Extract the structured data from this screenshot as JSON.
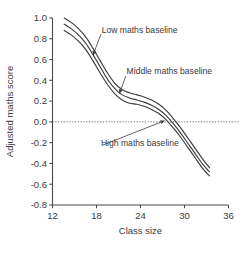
{
  "chart_data": {
    "type": "line",
    "title": "",
    "xlabel": "Class size",
    "ylabel": "Adjusted maths score",
    "xlim": [
      12,
      36
    ],
    "ylim": [
      -0.8,
      1.0
    ],
    "xticks": [
      12,
      18,
      24,
      30,
      36
    ],
    "yticks": [
      1.0,
      0.8,
      0.6,
      0.4,
      0.2,
      0.0,
      -0.2,
      -0.4,
      -0.6,
      -0.8
    ],
    "xtick_labels": [
      "12",
      "18",
      "24",
      "30",
      "36"
    ],
    "ytick_labels": [
      "1.0",
      "0.8",
      "0.6",
      "0.4",
      "0.2",
      "0.0",
      "-0.2",
      "-0.4",
      "-0.6",
      "-0.8"
    ],
    "grid": false,
    "legend_position": "inline-annotations",
    "reference_lines": [
      {
        "name": "zero-line",
        "axis": "y",
        "value": 0.0,
        "style": "dotted"
      }
    ],
    "series": [
      {
        "name": "Low maths baseline",
        "color": "#3b3b3b",
        "x": [
          13.6,
          14.5,
          15.5,
          16.5,
          17.5,
          18.5,
          19.5,
          20.5,
          21.5,
          22.5,
          23.5,
          24.5,
          25.5,
          26.5,
          27.5,
          28.5,
          29.5,
          30.5,
          31.5,
          32.5,
          33.4
        ],
        "y": [
          1.0,
          0.96,
          0.9,
          0.82,
          0.71,
          0.59,
          0.47,
          0.37,
          0.31,
          0.28,
          0.26,
          0.24,
          0.21,
          0.17,
          0.11,
          0.03,
          -0.06,
          -0.16,
          -0.26,
          -0.36,
          -0.44
        ]
      },
      {
        "name": "Middle maths baseline",
        "color": "#3b3b3b",
        "x": [
          13.6,
          14.5,
          15.5,
          16.5,
          17.5,
          18.5,
          19.5,
          20.5,
          21.5,
          22.5,
          23.5,
          24.5,
          25.5,
          26.5,
          27.5,
          28.5,
          29.5,
          30.5,
          31.5,
          32.5,
          33.4
        ],
        "y": [
          0.94,
          0.9,
          0.84,
          0.76,
          0.65,
          0.53,
          0.41,
          0.32,
          0.26,
          0.23,
          0.21,
          0.19,
          0.16,
          0.12,
          0.06,
          -0.02,
          -0.11,
          -0.21,
          -0.31,
          -0.41,
          -0.48
        ]
      },
      {
        "name": "High maths baseline",
        "color": "#3b3b3b",
        "x": [
          13.6,
          14.5,
          15.5,
          16.5,
          17.5,
          18.5,
          19.5,
          20.5,
          21.5,
          22.5,
          23.5,
          24.5,
          25.5,
          26.5,
          27.5,
          28.5,
          29.5,
          30.5,
          31.5,
          32.5,
          33.4
        ],
        "y": [
          0.88,
          0.84,
          0.78,
          0.7,
          0.59,
          0.47,
          0.36,
          0.27,
          0.21,
          0.18,
          0.17,
          0.15,
          0.12,
          0.08,
          0.02,
          -0.06,
          -0.15,
          -0.25,
          -0.35,
          -0.45,
          -0.52
        ]
      }
    ],
    "annotations": [
      {
        "name": "low-maths-baseline",
        "text": "Low maths baseline",
        "text_x": 18.7,
        "text_y": 0.86,
        "point_x": 17.4,
        "point_y": 0.62
      },
      {
        "name": "middle-maths-baseline",
        "text": "Middle maths baseline",
        "text_x": 22.1,
        "text_y": 0.46,
        "point_x": 21.0,
        "point_y": 0.25
      },
      {
        "name": "high-maths-baseline",
        "text": "High maths baseline",
        "text_x": 18.6,
        "text_y": -0.23,
        "point_x": 27.6,
        "point_y": 0.02
      }
    ]
  },
  "colors": {
    "line": "#3b3b3b",
    "axis": "#4a4a4a",
    "text": "#3a3a3a",
    "background": "#ffffff"
  }
}
